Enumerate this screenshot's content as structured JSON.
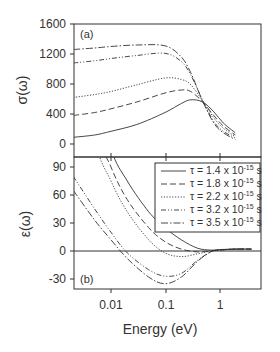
{
  "chart_data": [
    {
      "panel": "a",
      "type": "line",
      "panel_label": "(a)",
      "title": "",
      "xlabel": "Energy (eV)",
      "ylabel": "σ(ω)",
      "xscale": "log",
      "xlim": [
        0.002,
        5.8
      ],
      "ylim": [
        -150,
        1600
      ],
      "yticks": [
        0,
        400,
        800,
        1200,
        1600
      ],
      "ytick_labels": [
        "0",
        "400",
        "800",
        "1200",
        "1600"
      ],
      "grid": false,
      "x": [
        0.002,
        0.005,
        0.01,
        0.03,
        0.1,
        0.2,
        0.3,
        0.5,
        0.8,
        1.2,
        2.0
      ],
      "series": [
        {
          "name": "τ = 1.4 x 10^-15 s",
          "style": "solid",
          "values": [
            90,
            120,
            170,
            260,
            420,
            540,
            590,
            560,
            430,
            280,
            150
          ]
        },
        {
          "name": "τ = 1.8 x 10^-15 s",
          "style": "dashed",
          "values": [
            380,
            420,
            470,
            560,
            680,
            720,
            700,
            560,
            380,
            240,
            120
          ]
        },
        {
          "name": "τ = 2.2 x 10^-15 s",
          "style": "dotted",
          "values": [
            620,
            660,
            700,
            790,
            880,
            860,
            790,
            570,
            350,
            210,
            100
          ]
        },
        {
          "name": "τ = 3.2 x 10^-15 s",
          "style": "dash-dot-dot",
          "values": [
            1080,
            1110,
            1140,
            1180,
            1210,
            1100,
            920,
            580,
            300,
            170,
            80
          ]
        },
        {
          "name": "τ = 3.5 x 10^-15 s",
          "style": "dash-dot",
          "values": [
            1260,
            1280,
            1300,
            1320,
            1310,
            1160,
            950,
            570,
            280,
            150,
            60
          ]
        }
      ]
    },
    {
      "panel": "b",
      "type": "line",
      "panel_label": "(b)",
      "title": "",
      "xlabel": "Energy (eV)",
      "ylabel": "ε(ω)",
      "xscale": "log",
      "xlim": [
        0.002,
        5.8
      ],
      "ylim": [
        -40,
        100
      ],
      "yticks": [
        -30,
        0,
        30,
        60,
        90
      ],
      "ytick_labels": [
        "-30",
        "0",
        "30",
        "60",
        "90"
      ],
      "xticks": [
        0.01,
        0.1,
        1
      ],
      "xtick_labels": [
        "0.01",
        "0.1",
        "1"
      ],
      "grid": false,
      "zero_line": true,
      "legend_position": "upper right",
      "x": [
        0.002,
        0.005,
        0.01,
        0.02,
        0.05,
        0.1,
        0.2,
        0.4,
        0.7,
        1.0,
        2.0,
        4.0
      ],
      "series": [
        {
          "name": "τ = 1.4 x 10^-15 s",
          "style": "solid",
          "values": [
            400,
            190,
            110,
            75,
            42,
            25,
            12,
            3,
            1,
            1.5,
            2,
            2
          ]
        },
        {
          "name": "τ = 1.8 x 10^-15 s",
          "style": "dashed",
          "values": [
            300,
            140,
            90,
            55,
            25,
            10,
            2,
            -1,
            0,
            1,
            2,
            2
          ]
        },
        {
          "name": "τ = 2.2 x 10^-15 s",
          "style": "dotted",
          "values": [
            250,
            120,
            75,
            42,
            12,
            -2,
            -6,
            -3,
            0,
            1,
            2,
            2
          ]
        },
        {
          "name": "τ = 3.2 x 10^-15 s",
          "style": "dash-dot-dot",
          "values": [
            80,
            45,
            20,
            -2,
            -20,
            -27,
            -24,
            -10,
            -1,
            1,
            2,
            2
          ]
        },
        {
          "name": "τ = 3.5 x 10^-15 s",
          "style": "dash-dot",
          "values": [
            65,
            33,
            12,
            -8,
            -28,
            -35,
            -28,
            -11,
            -1,
            1,
            2,
            2
          ]
        }
      ]
    }
  ],
  "legend": {
    "entries": [
      {
        "tau": "τ = 1.4 x 10",
        "exp": "-15",
        "unit": " s",
        "style": "solid"
      },
      {
        "tau": "τ = 1.8 x 10",
        "exp": "-15",
        "unit": " s",
        "style": "dashed"
      },
      {
        "tau": "τ = 2.2 x 10",
        "exp": "-15",
        "unit": " s",
        "style": "dotted"
      },
      {
        "tau": "τ = 3.2 x 10",
        "exp": "-15",
        "unit": " s",
        "style": "dash-dot-dot"
      },
      {
        "tau": "τ = 3.5 x 10",
        "exp": "-15",
        "unit": " s",
        "style": "dash-dot"
      }
    ]
  },
  "labels": {
    "panel_a": "(a)",
    "panel_b": "(b)",
    "ylabel_a": "σ(ω)",
    "ylabel_b": "ε(ω)",
    "xlabel": "Energy (eV)",
    "a_ticks": [
      "1600",
      "1200",
      "800",
      "400",
      "0"
    ],
    "b_ticks": [
      "90",
      "60",
      "30",
      "0",
      "-30"
    ],
    "x_ticks": [
      "0.01",
      "0.1",
      "1"
    ]
  },
  "colors": {
    "axis": "#333333",
    "line": "#333333"
  }
}
